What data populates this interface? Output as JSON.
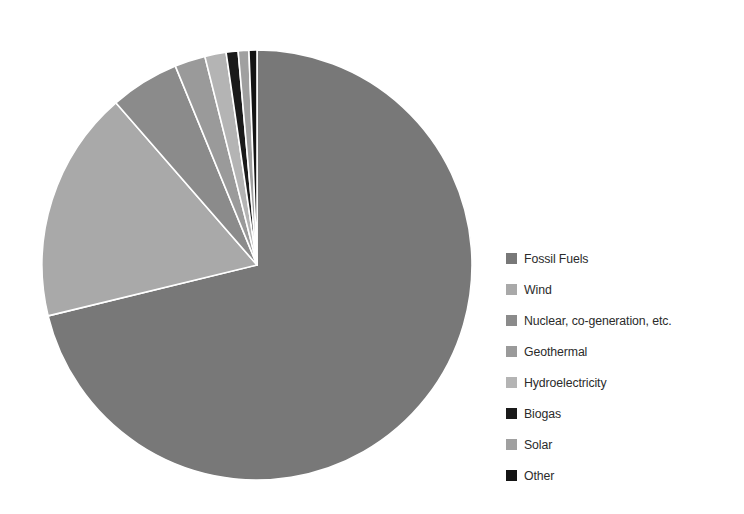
{
  "chart_data": {
    "type": "pie",
    "title": "",
    "subtitle": "",
    "xlabel": "",
    "ylabel": "",
    "grid": false,
    "legend_position": "right",
    "start_angle_deg": 0,
    "direction": "clockwise",
    "categories": [
      "Fossil Fuels",
      "Wind",
      "Nuclear, co-generation, etc.",
      "Geothermal",
      "Hydroelectricity",
      "Biogas",
      "Solar",
      "Other"
    ],
    "values": [
      71.2,
      17.4,
      5.2,
      2.3,
      1.6,
      0.9,
      0.8,
      0.6
    ],
    "unit": "%",
    "colors": [
      "#787878",
      "#a9a9a9",
      "#8b8b8b",
      "#9a9a9a",
      "#b4b4b4",
      "#1a1a1a",
      "#a0a0a0",
      "#141414"
    ],
    "slice_separator_color": "#ffffff",
    "background_color": "#ffffff",
    "slices": [
      {
        "label": "Fossil Fuels",
        "value": 71.2,
        "color": "#787878"
      },
      {
        "label": "Wind",
        "value": 17.4,
        "color": "#a9a9a9"
      },
      {
        "label": "Nuclear, co-generation, etc.",
        "value": 5.2,
        "color": "#8b8b8b"
      },
      {
        "label": "Geothermal",
        "value": 2.3,
        "color": "#9a9a9a"
      },
      {
        "label": "Hydroelectricity",
        "value": 1.6,
        "color": "#b4b4b4"
      },
      {
        "label": "Biogas",
        "value": 0.9,
        "color": "#1a1a1a"
      },
      {
        "label": "Solar",
        "value": 0.8,
        "color": "#a0a0a0"
      },
      {
        "label": "Other",
        "value": 0.6,
        "color": "#141414"
      }
    ]
  },
  "legend": {
    "items": [
      {
        "label": "Fossil Fuels",
        "color": "#787878"
      },
      {
        "label": "Wind",
        "color": "#a9a9a9"
      },
      {
        "label": "Nuclear, co-generation, etc.",
        "color": "#8b8b8b"
      },
      {
        "label": "Geothermal",
        "color": "#9a9a9a"
      },
      {
        "label": "Hydroelectricity",
        "color": "#b4b4b4"
      },
      {
        "label": "Biogas",
        "color": "#1a1a1a"
      },
      {
        "label": "Solar",
        "color": "#a0a0a0"
      },
      {
        "label": "Other",
        "color": "#141414"
      }
    ]
  },
  "geometry": {
    "center_x": 227,
    "center_y": 241,
    "radius": 215
  }
}
